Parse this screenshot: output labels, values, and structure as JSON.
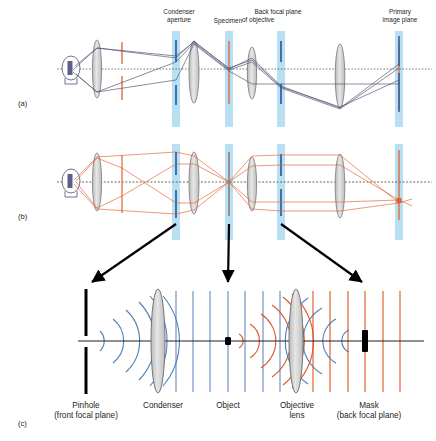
{
  "figure": {
    "panels": [
      {
        "id": "a",
        "label": "(a)",
        "x": 18,
        "y": 101,
        "ray_color": "#4a4f6e",
        "description": "Illumination ray paths (image-forming conjugate set)"
      },
      {
        "id": "b",
        "label": "(b)",
        "x": 18,
        "y": 214,
        "ray_color": "#e2622f",
        "description": "Illumination ray paths (aperture conjugate set)"
      },
      {
        "id": "c",
        "label": "(c)",
        "x": 18,
        "y": 421,
        "description": "Wavefront view of condenser, object, objective and mask"
      }
    ],
    "top_labels": [
      {
        "name": "condenser-aperture-label",
        "lines": [
          "Condenser",
          "aperture"
        ],
        "x": 179,
        "y": 11
      },
      {
        "name": "specimen-label",
        "lines": [
          "Specimen"
        ],
        "x": 228,
        "y": 20
      },
      {
        "name": "back-focal-plane-label",
        "lines": [
          "Back focal plane",
          "of objective"
        ],
        "x": 277,
        "y": 11
      },
      {
        "name": "primary-image-plane-label",
        "lines": [
          "Primary",
          "image plane"
        ],
        "x": 399,
        "y": 11
      }
    ],
    "bottom_labels": [
      {
        "name": "pinhole-label",
        "lines": [
          "Pinhole",
          "(front focal plane)"
        ],
        "x": 85,
        "y": 405
      },
      {
        "name": "condenser-label",
        "lines": [
          "Condenser"
        ],
        "x": 163,
        "y": 405
      },
      {
        "name": "object-label",
        "lines": [
          "Object"
        ],
        "x": 228,
        "y": 405
      },
      {
        "name": "objective-lens-label",
        "lines": [
          "Objective",
          "lens"
        ],
        "x": 297,
        "y": 405
      },
      {
        "name": "mask-label",
        "lines": [
          "Mask",
          "(back focal plane)"
        ],
        "x": 365,
        "y": 405
      }
    ],
    "colors": {
      "band_blue": "#b9dff2",
      "marker_blue": "#2c5f9e",
      "orange": "#e2622f",
      "ray_dark": "#4a4f6e",
      "axis": "#231f20",
      "lens_fill": "#d4d4d4",
      "lens_stroke": "#6b6b6b",
      "arrow_black": "#000000",
      "wave_blue": "#4a7fb5",
      "wave_orange": "#d9552b"
    },
    "axis_y": {
      "panel_a": 69,
      "panel_b": 182,
      "panel_c": 341
    },
    "planes_panel_a": [
      {
        "name": "lamp",
        "x": 71
      },
      {
        "name": "collector-lens",
        "x": 97
      },
      {
        "name": "field-diaphragm",
        "x": 122,
        "color": "orange"
      },
      {
        "name": "condenser-aperture",
        "x": 176,
        "color": "band"
      },
      {
        "name": "condenser-lens",
        "x": 194
      },
      {
        "name": "specimen",
        "x": 229,
        "color": "band"
      },
      {
        "name": "objective-lens",
        "x": 252
      },
      {
        "name": "back-focal-plane",
        "x": 281,
        "color": "band"
      },
      {
        "name": "tube-lens",
        "x": 340
      },
      {
        "name": "primary-image-plane",
        "x": 399,
        "color": "band"
      }
    ],
    "panel_c_elements": [
      {
        "name": "pinhole",
        "x": 86
      },
      {
        "name": "condenser",
        "x": 158
      },
      {
        "name": "object",
        "x": 228
      },
      {
        "name": "objective-lens",
        "x": 296
      },
      {
        "name": "mask",
        "x": 365
      }
    ],
    "connector_arrows": [
      {
        "name": "arrow-pinhole",
        "from_x": 176,
        "from_y": 222,
        "to_x": 88,
        "to_y": 285
      },
      {
        "name": "arrow-object",
        "from_x": 229,
        "from_y": 222,
        "to_x": 228,
        "to_y": 285
      },
      {
        "name": "arrow-mask",
        "from_x": 281,
        "from_y": 222,
        "to_x": 366,
        "to_y": 285
      }
    ]
  }
}
